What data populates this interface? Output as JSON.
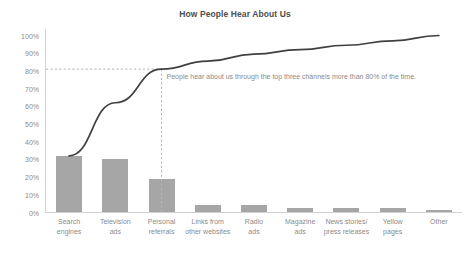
{
  "chart_data": {
    "type": "bar",
    "title": "How People Hear About Us",
    "xlabel": "",
    "ylabel": "",
    "ylim": [
      0,
      100
    ],
    "grid": false,
    "legend": false,
    "categories": [
      "Search\nengines",
      "Television\nads",
      "Personal\nreferrals",
      "Links from\nother websites",
      "Radio\nads",
      "Magazine\nads",
      "News stories/\npress releases",
      "Yellow\npages",
      "Other"
    ],
    "values": [
      32,
      30,
      19,
      4.5,
      4,
      2.5,
      2.5,
      2.5,
      1.5
    ],
    "series": [
      {
        "name": "Share of responses",
        "type": "bar",
        "values": [
          32,
          30,
          19,
          4.5,
          4,
          2.5,
          2.5,
          2.5,
          1.5
        ]
      },
      {
        "name": "Cumulative percentage",
        "type": "line",
        "values": [
          32,
          62,
          81,
          85.5,
          89.5,
          92,
          94.5,
          97,
          100
        ]
      }
    ],
    "ytick_labels": [
      "100%",
      "90%",
      "80%",
      "70%",
      "60%",
      "50%",
      "40%",
      "30%",
      "20%",
      "10%",
      "0%"
    ],
    "ytick_values": [
      100,
      90,
      80,
      70,
      60,
      50,
      40,
      30,
      20,
      10,
      0
    ],
    "annotations": [
      {
        "text": "People hear about us through the top three channels more than 80% of the time.",
        "reference_value": 81,
        "reference_category": "Personal referrals"
      }
    ],
    "colors": {
      "bar": "#a6a6a6",
      "line": "#404040",
      "reference_line": "#b5b5b5",
      "axis": "#d2d2d2",
      "tick_label": "#8b8b8b",
      "title": "#4d4d4d",
      "annotation": "#8b8b8b",
      "background": "#ffffff"
    }
  }
}
